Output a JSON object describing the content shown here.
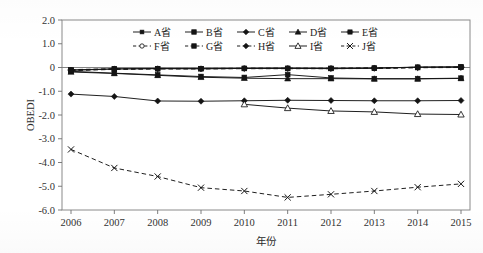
{
  "chart_data": {
    "type": "line",
    "title": "",
    "subtitle": "",
    "xlabel": "年份",
    "ylabel": "OBEDI",
    "x": [
      2006,
      2007,
      2008,
      2009,
      2010,
      2011,
      2012,
      2013,
      2014,
      2015
    ],
    "xtick_labels": [
      "2006",
      "2007",
      "2008",
      "2009",
      "2010",
      "2011",
      "2012",
      "2013",
      "2014",
      "2015"
    ],
    "ytick_labels": [
      "2.0",
      "1.0",
      "0",
      "-1.0",
      "-2.0",
      "-3.0",
      "-4.0",
      "-5.0",
      "-6.0"
    ],
    "ytick_values": [
      2.0,
      1.0,
      0,
      -1.0,
      -2.0,
      -3.0,
      -4.0,
      -5.0,
      -6.0
    ],
    "ylim": [
      -6.0,
      2.0
    ],
    "xlim": [
      2006,
      2015
    ],
    "grid": false,
    "zero_reference_line": true,
    "legend_position": "upper-center-inside",
    "legend_columns": 5,
    "legend_rows": 2,
    "series": [
      {
        "name": "A省",
        "marker": "filled-square-small",
        "linestyle": "solid",
        "values": [
          -0.12,
          -0.06,
          -0.04,
          -0.05,
          -0.04,
          -0.03,
          -0.05,
          -0.03,
          0.02,
          0.03
        ]
      },
      {
        "name": "B省",
        "marker": "filled-square",
        "linestyle": "solid",
        "values": [
          -0.16,
          -0.24,
          -0.31,
          -0.38,
          -0.42,
          -0.3,
          -0.44,
          -0.47,
          -0.47,
          -0.45
        ]
      },
      {
        "name": "C省",
        "marker": "filled-diamond",
        "linestyle": "solid",
        "values": [
          -1.12,
          -1.22,
          -1.41,
          -1.42,
          -1.4,
          -1.38,
          -1.39,
          -1.4,
          -1.4,
          -1.39
        ]
      },
      {
        "name": "D省",
        "marker": "filled-triangle",
        "linestyle": "solid",
        "values": [
          -0.19,
          -0.25,
          -0.33,
          -0.41,
          -0.45,
          -0.47,
          -0.47,
          -0.48,
          -0.48,
          -0.46
        ]
      },
      {
        "name": "E省",
        "marker": "filled-star",
        "linestyle": "solid",
        "values": [
          -0.1,
          -0.06,
          -0.05,
          -0.05,
          -0.04,
          -0.04,
          -0.04,
          -0.03,
          0.01,
          0.02
        ]
      },
      {
        "name": "F省",
        "marker": "open-circle",
        "linestyle": "dashed",
        "values": [
          -0.09,
          -0.05,
          -0.04,
          -0.04,
          -0.03,
          -0.03,
          -0.03,
          -0.02,
          0.01,
          0.02
        ]
      },
      {
        "name": "G省",
        "marker": "filled-square-hatch",
        "linestyle": "dashed",
        "values": [
          -0.11,
          -0.07,
          -0.05,
          -0.05,
          -0.04,
          -0.04,
          -0.04,
          -0.03,
          0.0,
          0.01
        ]
      },
      {
        "name": "H省",
        "marker": "open-diamond",
        "linestyle": "dashed",
        "values": [
          -0.13,
          -0.08,
          -0.06,
          -0.06,
          -0.05,
          -0.05,
          -0.05,
          -0.04,
          -0.01,
          0.0
        ]
      },
      {
        "name": "I省",
        "marker": "open-triangle",
        "linestyle": "solid",
        "values": [
          null,
          null,
          null,
          null,
          -1.55,
          -1.71,
          -1.83,
          -1.87,
          -1.96,
          -1.98
        ]
      },
      {
        "name": "J省",
        "marker": "cross-x",
        "linestyle": "dashed",
        "values": [
          -3.45,
          -4.23,
          -4.59,
          -5.06,
          -5.2,
          -5.47,
          -5.34,
          -5.2,
          -5.04,
          -4.9
        ]
      }
    ]
  },
  "legend": {
    "row1": [
      "A省",
      "B省",
      "C省",
      "D省",
      "E省"
    ],
    "row2": [
      "F省",
      "G省",
      "H省",
      "I省",
      "J省"
    ]
  },
  "axes": {
    "y_title": "OBEDI",
    "x_title": "年份"
  }
}
